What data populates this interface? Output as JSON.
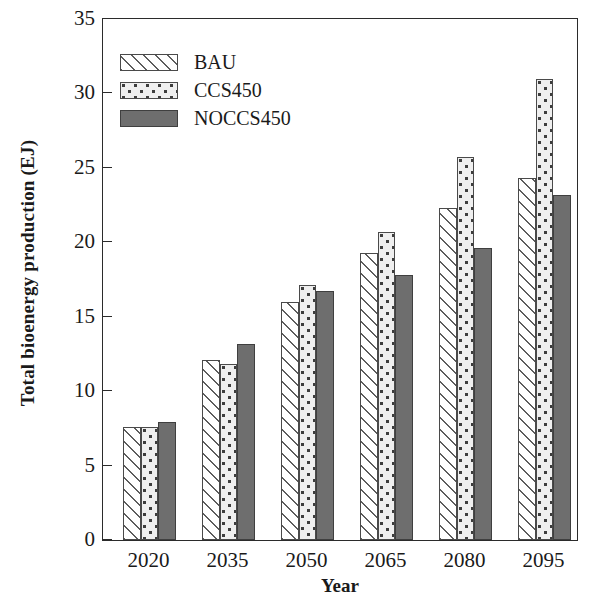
{
  "chart_data": {
    "type": "bar",
    "title": "",
    "xlabel": "Year",
    "ylabel": "Total bioenergy production (EJ)",
    "categories": [
      "2020",
      "2035",
      "2050",
      "2065",
      "2080",
      "2095"
    ],
    "series": [
      {
        "name": "BAU",
        "values": [
          7.6,
          12.1,
          16.0,
          19.3,
          22.3,
          24.3
        ]
      },
      {
        "name": "CCS450",
        "values": [
          7.6,
          11.8,
          17.1,
          20.7,
          25.7,
          31.0
        ]
      },
      {
        "name": "NOCCS450",
        "values": [
          7.9,
          13.2,
          16.7,
          17.8,
          19.6,
          23.2
        ]
      }
    ],
    "ylim": [
      0,
      35
    ],
    "yticks": [
      0,
      5,
      10,
      15,
      20,
      25,
      30,
      35
    ],
    "ytick_labels": [
      "0",
      "5",
      "10",
      "15",
      "20",
      "25",
      "30",
      "35"
    ],
    "grid": false,
    "legend_position": "upper left",
    "legend": [
      {
        "label": "BAU",
        "pattern": "diagonal-hatch",
        "color": "#ffffff"
      },
      {
        "label": "CCS450",
        "pattern": "dots",
        "color": "#efefef"
      },
      {
        "label": "NOCCS450",
        "pattern": "solid",
        "color": "#6e6e6e"
      }
    ],
    "axis_color": "#2b2b2b"
  }
}
